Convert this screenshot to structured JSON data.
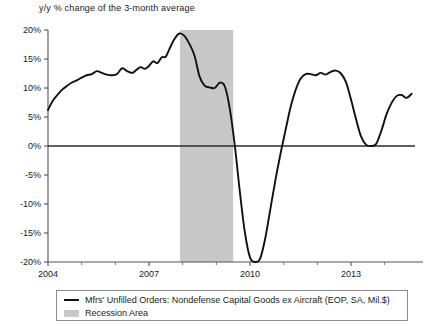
{
  "chart_data": {
    "type": "line",
    "title": "y/y % change of the 3-month average",
    "xlabel": "",
    "ylabel": "",
    "xlim": [
      2004.0,
      2014.9
    ],
    "ylim": [
      -20,
      20
    ],
    "grid": false,
    "legend_position": "below",
    "y_ticks": [
      "20%",
      "15%",
      "10%",
      "5%",
      "0%",
      "-5%",
      "-10%",
      "-15%",
      "-20%"
    ],
    "y_tick_values": [
      20,
      15,
      10,
      5,
      0,
      -5,
      -10,
      -15,
      -20
    ],
    "x_ticks": [
      "2004",
      "2007",
      "2010",
      "2013"
    ],
    "x_tick_values": [
      2004,
      2007,
      2010,
      2013
    ],
    "x_minor_ticks": [
      2005,
      2006,
      2008,
      2009,
      2011,
      2012,
      2014
    ],
    "zero_line": 0,
    "series": [
      {
        "name": "Mfrs' Unfilled Orders: Nondefense Capital Goods ex Aircraft (EOP, SA, Mil.$)",
        "color": "#111111",
        "x": [
          2004.0,
          2004.12,
          2004.25,
          2004.4,
          2004.55,
          2004.7,
          2004.85,
          2005.0,
          2005.15,
          2005.3,
          2005.45,
          2005.6,
          2005.75,
          2005.9,
          2006.05,
          2006.2,
          2006.35,
          2006.5,
          2006.62,
          2006.75,
          2006.88,
          2007.0,
          2007.12,
          2007.25,
          2007.38,
          2007.5,
          2007.62,
          2007.75,
          2007.9,
          2008.05,
          2008.2,
          2008.35,
          2008.5,
          2008.65,
          2008.8,
          2008.95,
          2009.1,
          2009.25,
          2009.4,
          2009.55,
          2009.7,
          2009.85,
          2010.0,
          2010.15,
          2010.3,
          2010.45,
          2010.6,
          2010.75,
          2010.9,
          2011.05,
          2011.2,
          2011.35,
          2011.5,
          2011.65,
          2011.8,
          2011.95,
          2012.1,
          2012.25,
          2012.4,
          2012.55,
          2012.7,
          2012.85,
          2013.0,
          2013.15,
          2013.3,
          2013.45,
          2013.6,
          2013.75,
          2013.9,
          2014.05,
          2014.2,
          2014.35,
          2014.5,
          2014.65,
          2014.8
        ],
        "y": [
          6.2,
          7.6,
          8.6,
          9.6,
          10.3,
          10.9,
          11.3,
          11.8,
          12.2,
          12.4,
          12.9,
          12.6,
          12.3,
          12.2,
          12.4,
          13.4,
          12.9,
          12.6,
          13.1,
          13.6,
          13.3,
          13.8,
          14.6,
          14.3,
          15.3,
          15.4,
          16.9,
          18.4,
          19.4,
          19.0,
          17.6,
          15.6,
          12.0,
          10.4,
          10.1,
          10.0,
          10.9,
          10.3,
          6.4,
          0.0,
          -8.0,
          -15.0,
          -19.2,
          -20.0,
          -19.4,
          -16.0,
          -11.0,
          -6.0,
          -1.5,
          2.6,
          6.6,
          9.6,
          11.6,
          12.4,
          12.4,
          12.2,
          12.6,
          12.3,
          12.8,
          13.0,
          12.5,
          11.0,
          8.0,
          4.6,
          1.6,
          0.2,
          0.0,
          0.4,
          2.6,
          5.4,
          7.4,
          8.6,
          8.8,
          8.3,
          9.0
        ]
      }
    ],
    "shaded_regions": [
      {
        "name": "Recession Area",
        "color": "#c8c8c8",
        "x_start": 2007.92,
        "x_end": 2009.5
      }
    ]
  },
  "legend": {
    "entries": [
      {
        "label": "Mfrs' Unfilled Orders: Nondefense Capital Goods ex Aircraft (EOP, SA, Mil.$)",
        "swatch": "line-swatch"
      },
      {
        "label": "Recession Area",
        "swatch": "area-swatch"
      }
    ]
  }
}
